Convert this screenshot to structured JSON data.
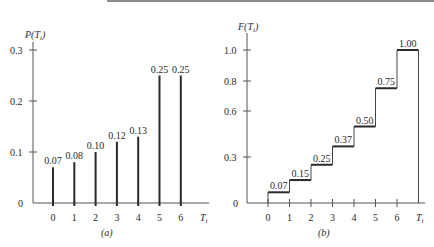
{
  "chart_data": [
    {
      "type": "bar",
      "panel": "(a)",
      "title": "",
      "ylabel": "P(T_i)",
      "xlabel": "T_i",
      "categories": [
        "0",
        "1",
        "2",
        "3",
        "4",
        "5",
        "6"
      ],
      "values": [
        0.07,
        0.08,
        0.1,
        0.12,
        0.13,
        0.25,
        0.25
      ],
      "value_labels": [
        "0.07",
        "0.08",
        "0.10",
        "0.12",
        "0.13",
        "0.25",
        "0.25"
      ],
      "yticks": [
        "0",
        "0.1",
        "0.2",
        "0.3"
      ],
      "ylim": [
        0,
        0.3
      ],
      "grid": false,
      "style": "stem"
    },
    {
      "type": "line",
      "panel": "(b)",
      "title": "",
      "ylabel": "F(T_i)",
      "xlabel": "T_i",
      "categories": [
        "0",
        "1",
        "2",
        "3",
        "4",
        "5",
        "6"
      ],
      "values": [
        0.07,
        0.15,
        0.25,
        0.37,
        0.5,
        0.75,
        1.0
      ],
      "value_labels": [
        "0.07",
        "0.15",
        "0.25",
        "0.37",
        "0.50",
        "0.75",
        "1.00"
      ],
      "yticks": [
        "0",
        "0.3",
        "0.6",
        "0.8",
        "1.0"
      ],
      "ylim": [
        0,
        1.0
      ],
      "grid": false,
      "style": "step"
    }
  ],
  "left": {
    "ylabel_main": "P(T",
    "ylabel_sub": "i",
    "ylabel_close": ")",
    "yticks": [
      {
        "label": "0.3",
        "y": 50
      },
      {
        "label": "0.2",
        "y": 101
      },
      {
        "label": "0.1",
        "y": 152
      }
    ],
    "zero_label": "0",
    "xticks": [
      "0",
      "1",
      "2",
      "3",
      "4",
      "5",
      "6"
    ],
    "value_labels": [
      "0.07",
      "0.08",
      "0.10",
      "0.12",
      "0.13",
      "0.25",
      "0.25"
    ],
    "xlabel_main": "T",
    "xlabel_sub": "i",
    "panel_label": "(a)"
  },
  "right": {
    "ylabel_main": "F(T",
    "ylabel_sub": "i",
    "ylabel_close": ")",
    "yticks": [
      {
        "label": "1.0",
        "y": 50
      },
      {
        "label": "0.8",
        "y": 81
      },
      {
        "label": "0.6",
        "y": 111
      },
      {
        "label": "0.3",
        "y": 157
      }
    ],
    "zero_label": "0",
    "xticks": [
      "0",
      "1",
      "2",
      "3",
      "4",
      "5",
      "6"
    ],
    "value_labels": [
      "0.07",
      "0.15",
      "0.25",
      "0.37",
      "0.50",
      "0.75",
      "1.00"
    ],
    "xlabel_main": "T",
    "xlabel_sub": "i",
    "panel_label": "(b)"
  },
  "colors": {
    "ink": "#2a2a2a",
    "axis": "#555555",
    "topbar": "#8a8a8a"
  }
}
